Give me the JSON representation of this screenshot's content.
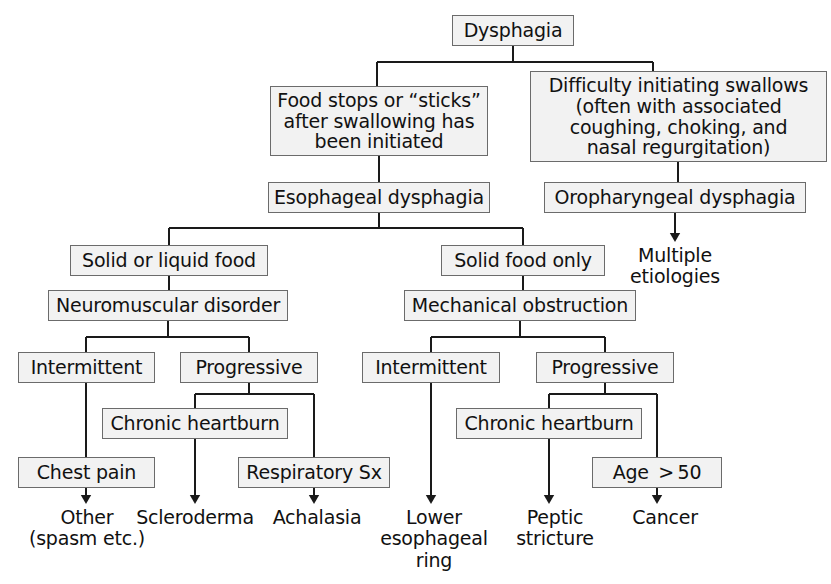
{
  "diagram": {
    "type": "flowchart",
    "colors": {
      "box_fill": "#f2f2f2",
      "box_border": "#6b6b6b",
      "edge": "#1a1a1a",
      "text": "#111111",
      "background": "#ffffff"
    },
    "nodes": [
      {
        "id": "dysphagia",
        "label": "Dysphagia",
        "style": "box",
        "x": 452,
        "y": 15,
        "w": 122,
        "h": 31
      },
      {
        "id": "food_stops",
        "label": "Food stops or “sticks”\nafter swallowing has\nbeen initiated",
        "style": "box",
        "x": 270,
        "y": 86,
        "w": 218,
        "h": 70
      },
      {
        "id": "difficulty_initiating",
        "label": "Difficulty initiating swallows\n(often with associated\ncoughing, choking, and\nnasal regurgitation)",
        "style": "box",
        "x": 530,
        "y": 71,
        "w": 297,
        "h": 91
      },
      {
        "id": "esophageal_dysphagia",
        "label": "Esophageal dysphagia",
        "style": "box",
        "x": 268,
        "y": 182,
        "w": 222,
        "h": 31
      },
      {
        "id": "oropharyngeal_dysphagia",
        "label": "Oropharyngeal dysphagia",
        "style": "box",
        "x": 544,
        "y": 182,
        "w": 262,
        "h": 31
      },
      {
        "id": "multiple_etiologies",
        "label": "Multiple\netiologies",
        "style": "plain",
        "x": 612,
        "y": 245,
        "w": 126,
        "h": 50
      },
      {
        "id": "solid_or_liquid",
        "label": "Solid or liquid food",
        "style": "box",
        "x": 70,
        "y": 245,
        "w": 198,
        "h": 31
      },
      {
        "id": "solid_only",
        "label": "Solid food only",
        "style": "box",
        "x": 441,
        "y": 245,
        "w": 164,
        "h": 31
      },
      {
        "id": "neuromuscular",
        "label": "Neuromuscular disorder",
        "style": "box",
        "x": 48,
        "y": 290,
        "w": 240,
        "h": 31
      },
      {
        "id": "mechanical",
        "label": "Mechanical obstruction",
        "style": "box",
        "x": 404,
        "y": 290,
        "w": 232,
        "h": 31
      },
      {
        "id": "intermittent_nm",
        "label": "Intermittent",
        "style": "box",
        "x": 18,
        "y": 352,
        "w": 137,
        "h": 31
      },
      {
        "id": "progressive_nm",
        "label": "Progressive",
        "style": "box",
        "x": 180,
        "y": 352,
        "w": 138,
        "h": 31
      },
      {
        "id": "intermittent_mech",
        "label": "Intermittent",
        "style": "box",
        "x": 362,
        "y": 352,
        "w": 138,
        "h": 31
      },
      {
        "id": "progressive_mech",
        "label": "Progressive",
        "style": "box",
        "x": 536,
        "y": 352,
        "w": 138,
        "h": 31
      },
      {
        "id": "chronic_heartburn_nm",
        "label": "Chronic heartburn",
        "style": "box",
        "x": 102,
        "y": 408,
        "w": 186,
        "h": 31
      },
      {
        "id": "chronic_heartburn_mech",
        "label": "Chronic heartburn",
        "style": "box",
        "x": 456,
        "y": 408,
        "w": 186,
        "h": 31
      },
      {
        "id": "chest_pain",
        "label": "Chest pain",
        "style": "box",
        "x": 18,
        "y": 457,
        "w": 137,
        "h": 31
      },
      {
        "id": "respiratory_sx",
        "label": "Respiratory Sx",
        "style": "box",
        "x": 238,
        "y": 457,
        "w": 152,
        "h": 31
      },
      {
        "id": "age_over_50",
        "label": "Age  > 50",
        "style": "box",
        "x": 592,
        "y": 457,
        "w": 130,
        "h": 31
      },
      {
        "id": "other_spasm",
        "label": "Other\n(spasm etc.)",
        "style": "plain",
        "x": 24,
        "y": 507,
        "w": 126,
        "h": 50
      },
      {
        "id": "scleroderma",
        "label": "Scleroderma",
        "style": "plain",
        "x": 131,
        "y": 507,
        "w": 128,
        "h": 26
      },
      {
        "id": "achalasia",
        "label": "Achalasia",
        "style": "plain",
        "x": 259,
        "y": 507,
        "w": 116,
        "h": 26
      },
      {
        "id": "lower_esoph_ring",
        "label": "Lower\nesophageal\nring",
        "style": "plain",
        "x": 372,
        "y": 507,
        "w": 124,
        "h": 74
      },
      {
        "id": "peptic_stricture",
        "label": "Peptic\nstricture",
        "style": "plain",
        "x": 497,
        "y": 507,
        "w": 116,
        "h": 50
      },
      {
        "id": "cancer",
        "label": "Cancer",
        "style": "plain",
        "x": 613,
        "y": 507,
        "w": 104,
        "h": 26
      }
    ],
    "edges": [
      {
        "from": "dysphagia",
        "to": "food_stops",
        "kind": "split-line",
        "arrow": false
      },
      {
        "from": "dysphagia",
        "to": "difficulty_initiating",
        "kind": "split-line",
        "arrow": false
      },
      {
        "from": "food_stops",
        "to": "esophageal_dysphagia",
        "kind": "straight",
        "arrow": false
      },
      {
        "from": "difficulty_initiating",
        "to": "oropharyngeal_dysphagia",
        "kind": "straight",
        "arrow": false
      },
      {
        "from": "oropharyngeal_dysphagia",
        "to": "multiple_etiologies",
        "kind": "straight",
        "arrow": true
      },
      {
        "from": "esophageal_dysphagia",
        "to": "solid_or_liquid",
        "kind": "split-line",
        "arrow": false
      },
      {
        "from": "esophageal_dysphagia",
        "to": "solid_only",
        "kind": "split-line",
        "arrow": false
      },
      {
        "from": "solid_or_liquid",
        "to": "neuromuscular",
        "kind": "straight",
        "arrow": false
      },
      {
        "from": "solid_only",
        "to": "mechanical",
        "kind": "straight",
        "arrow": false
      },
      {
        "from": "neuromuscular",
        "to": "intermittent_nm",
        "kind": "split-line",
        "arrow": false
      },
      {
        "from": "neuromuscular",
        "to": "progressive_nm",
        "kind": "split-line",
        "arrow": false
      },
      {
        "from": "progressive_nm",
        "to": "chronic_heartburn_nm",
        "kind": "split-line",
        "arrow": false
      },
      {
        "from": "progressive_nm",
        "to": "respiratory_sx",
        "kind": "split-line",
        "arrow": false
      },
      {
        "from": "intermittent_nm",
        "to": "chest_pain",
        "kind": "straight",
        "arrow": false
      },
      {
        "from": "chest_pain",
        "to": "other_spasm",
        "kind": "straight",
        "arrow": true
      },
      {
        "from": "chronic_heartburn_nm",
        "to": "scleroderma",
        "kind": "straight",
        "arrow": true
      },
      {
        "from": "respiratory_sx",
        "to": "achalasia",
        "kind": "straight",
        "arrow": true
      },
      {
        "from": "mechanical",
        "to": "intermittent_mech",
        "kind": "split-line",
        "arrow": false
      },
      {
        "from": "mechanical",
        "to": "progressive_mech",
        "kind": "split-line",
        "arrow": false
      },
      {
        "from": "intermittent_mech",
        "to": "lower_esoph_ring",
        "kind": "straight",
        "arrow": true
      },
      {
        "from": "progressive_mech",
        "to": "chronic_heartburn_mech",
        "kind": "split-line",
        "arrow": false
      },
      {
        "from": "progressive_mech",
        "to": "age_over_50",
        "kind": "split-line",
        "arrow": false
      },
      {
        "from": "chronic_heartburn_mech",
        "to": "peptic_stricture",
        "kind": "straight",
        "arrow": true
      },
      {
        "from": "age_over_50",
        "to": "cancer",
        "kind": "straight",
        "arrow": true
      }
    ],
    "edge_paths": [
      "M 513 46 L 513 62",
      "M 377 62 L 653 62",
      "M 377 62 L 377 86",
      "M 653 62 L 653 71",
      "M 379 156 L 379 182",
      "M 678 162 L 678 182",
      "M 675 213 L 675 240",
      "M 379 213 L 379 228",
      "M 169 228 L 523 228",
      "M 169 228 L 169 245",
      "M 523 228 L 523 245",
      "M 169 276 L 169 290",
      "M 523 276 L 523 290",
      "M 168 321 L 168 337",
      "M 86 337 L 249 337",
      "M 86 337 L 86 352",
      "M 249 337 L 249 352",
      "M 520 321 L 520 337",
      "M 431 337 L 605 337",
      "M 431 337 L 431 352",
      "M 605 337 L 605 352",
      "M 249 383 L 249 394",
      "M 195 394 L 314 394",
      "M 195 394 L 195 408",
      "M 314 394 L 314 457",
      "M 86 383 L 86 457",
      "M 86 488 L 86 502",
      "M 195 439 L 195 502",
      "M 314 488 L 314 502",
      "M 605 383 L 605 394",
      "M 549 394 L 657 394",
      "M 549 394 L 549 408",
      "M 657 394 L 657 457",
      "M 431 383 L 431 502",
      "M 549 439 L 549 502",
      "M 657 488 L 657 502"
    ],
    "arrow_tips": [
      {
        "x": 675,
        "y": 242
      },
      {
        "x": 86,
        "y": 504
      },
      {
        "x": 195,
        "y": 504
      },
      {
        "x": 314,
        "y": 504
      },
      {
        "x": 431,
        "y": 504
      },
      {
        "x": 549,
        "y": 504
      },
      {
        "x": 657,
        "y": 504
      }
    ]
  }
}
